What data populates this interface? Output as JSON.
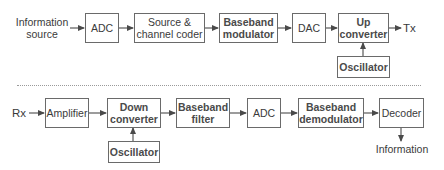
{
  "transmitter": {
    "input_label": "Information\nsource",
    "output_label": "Tx",
    "blocks": [
      {
        "id": "adc",
        "label": "ADC"
      },
      {
        "id": "source-channel-coder",
        "label": "Source &\nchannel coder"
      },
      {
        "id": "baseband-modulator",
        "label": "Baseband\nmodulator"
      },
      {
        "id": "dac",
        "label": "DAC"
      },
      {
        "id": "up-converter",
        "label": "Up\nconverter"
      }
    ],
    "oscillator": {
      "label": "Oscillator",
      "feeds": "up-converter"
    }
  },
  "receiver": {
    "input_label": "Rx",
    "output_label": "Information",
    "blocks": [
      {
        "id": "amplifier",
        "label": "Amplifier"
      },
      {
        "id": "down-converter",
        "label": "Down\nconverter"
      },
      {
        "id": "baseband-filter",
        "label": "Baseband\nfilter"
      },
      {
        "id": "adc",
        "label": "ADC"
      },
      {
        "id": "baseband-demodulator",
        "label": "Baseband\ndemodulator"
      },
      {
        "id": "decoder",
        "label": "Decoder"
      }
    ],
    "oscillator": {
      "label": "Oscillator",
      "feeds": "down-converter"
    }
  },
  "colors": {
    "stroke": "#6a6a6a",
    "text": "#3a3a3a",
    "divider": "#9a9a9a"
  }
}
